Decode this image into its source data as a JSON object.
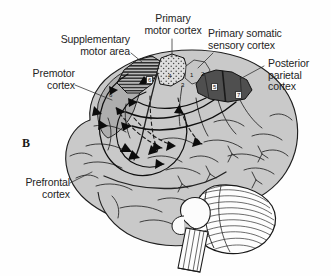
{
  "figure": {
    "panel_letter": "B",
    "background_color": "#fefefe",
    "ink_color": "#242424"
  },
  "labels": [
    {
      "name": "supplementary-motor-area",
      "text": "Supplementary\nmotor area",
      "x": 47,
      "y": 34
    },
    {
      "name": "primary-motor-cortex",
      "text": "Primary\nmotor cortex",
      "x": 147,
      "y": 13
    },
    {
      "name": "primary-somatic-sensory-cortex",
      "text": "Primary somatic\nsensory cortex",
      "x": 208,
      "y": 28
    },
    {
      "name": "posterior-parietal-cortex",
      "text": "Posterior\nparietal\ncortex",
      "x": 268,
      "y": 58
    },
    {
      "name": "premotor-cortex",
      "text": "Premotor\ncortex",
      "x": 37,
      "y": 68
    },
    {
      "name": "prefrontal-cortex",
      "text": "Prefrontal\ncortex",
      "x": 15,
      "y": 177
    }
  ],
  "brodmann_areas": [
    {
      "name": "area-6-sma",
      "value": "6",
      "x": 146,
      "y": 76,
      "boxed": true
    },
    {
      "name": "area-6-premotor",
      "value": "6",
      "x": 109,
      "y": 92,
      "boxed": false
    },
    {
      "name": "area-4",
      "value": "4",
      "x": 168,
      "y": 73,
      "boxed": false
    },
    {
      "name": "area-1",
      "value": "1",
      "x": 190,
      "y": 72,
      "boxed": false
    },
    {
      "name": "area-2",
      "value": "2",
      "x": 201,
      "y": 71,
      "boxed": false
    },
    {
      "name": "area-3",
      "value": "3",
      "x": 181,
      "y": 82,
      "boxed": false
    },
    {
      "name": "area-5",
      "value": "5",
      "x": 211,
      "y": 83,
      "boxed": true
    },
    {
      "name": "area-7",
      "value": "7",
      "x": 235,
      "y": 91,
      "boxed": true
    }
  ],
  "regions": [
    {
      "name": "supplementary-motor-area-region",
      "fill_pattern": "horizontal-hatch",
      "color": "#8a8a8a"
    },
    {
      "name": "primary-motor-cortex-region",
      "fill_pattern": "stipple",
      "color": "#d8d8d8"
    },
    {
      "name": "premotor-cortex-region",
      "fill_pattern": "light-gray",
      "color": "#b5b5b5"
    },
    {
      "name": "primary-somatic-sensory-cortex-region",
      "fill_pattern": "light-gray",
      "color": "#c4c4c4"
    },
    {
      "name": "posterior-parietal-cortex-region",
      "fill_pattern": "dark-gray",
      "color": "#555555"
    },
    {
      "name": "cerebral-cortex-body",
      "fill_pattern": "pale-gray",
      "color": "#c8c8c8"
    },
    {
      "name": "cerebellum",
      "fill_pattern": "curved-striations",
      "color": "#fbfbfb"
    },
    {
      "name": "brainstem",
      "fill_pattern": "outline",
      "color": "#fbfbfb"
    }
  ]
}
